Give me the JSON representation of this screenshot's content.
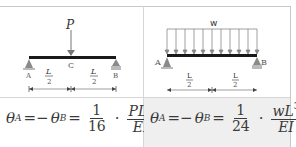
{
  "diagrams": {
    "point_load": {
      "load_label": "P",
      "center_label": "C",
      "support_left_label": "A",
      "support_right_label": "B",
      "span_left": {
        "num": "L",
        "den": "2"
      },
      "span_right": {
        "num": "L",
        "den": "2"
      }
    },
    "distributed_load": {
      "load_label": "w",
      "arrow_count": 11,
      "support_left_label": "A",
      "support_right_label": "B",
      "span_left": {
        "num": "L",
        "den": "2"
      },
      "span_right": {
        "num": "L",
        "den": "2"
      }
    }
  },
  "formulas": {
    "point_load": {
      "theta": "θ",
      "sub_a": "A",
      "eq_neg": "=−",
      "sub_b": "B",
      "eq": "=",
      "coef_num": "1",
      "coef_den": "16",
      "dot": "·",
      "num_base": "PL",
      "num_exp": "2",
      "den": "EI"
    },
    "distributed_load": {
      "theta": "θ",
      "sub_a": "A",
      "eq_neg": "=−",
      "sub_b": "B",
      "eq": "=",
      "coef_num": "1",
      "coef_den": "24",
      "dot": "·",
      "num_base": "wL",
      "num_exp": "3",
      "den": "EI"
    }
  },
  "colors": {
    "beam": "#1a1a1a",
    "lines": "#777777",
    "grid": "#d6d6d6",
    "formula_bg_highlight": "#efefef"
  }
}
